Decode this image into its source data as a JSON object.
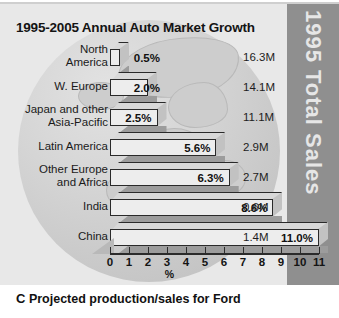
{
  "chart_data": {
    "type": "bar",
    "title": "1995-2005 Annual Auto Market Growth",
    "xlabel": "%",
    "ylabel": "",
    "orientation": "horizontal",
    "xlim": [
      0,
      11
    ],
    "xticks": [
      "0",
      "1",
      "2",
      "3",
      "4",
      "5",
      "6",
      "7",
      "8",
      "9",
      "10",
      "11"
    ],
    "grid": false,
    "categories": [
      "North\nAmerica",
      "W. Europe",
      "Japan and other\nAsia-Pacific",
      "Latin America",
      "Other Europe\nand Africa",
      "India",
      "China"
    ],
    "values": [
      0.5,
      2.0,
      2.5,
      5.6,
      6.3,
      8.6,
      11.0
    ],
    "value_labels": [
      "0.5%",
      "2.0%",
      "2.5%",
      "5.6%",
      "6.3%",
      "8.6%",
      "11.0%"
    ],
    "series": [
      {
        "name": "1995-2005 Annual Auto Market Growth",
        "values": [
          0.5,
          2.0,
          2.5,
          5.6,
          6.3,
          8.6,
          11.0
        ]
      }
    ],
    "secondary_column": {
      "header": "1995 Total Sales",
      "values": [
        "16.3M",
        "14.1M",
        "11.1M",
        "2.9M",
        "2.7M",
        "0.6M",
        "1.4M"
      ]
    },
    "annotations": [
      "C  Projected production/sales for Ford"
    ]
  },
  "sidebar": {
    "label": "1995 Total Sales"
  },
  "axis": {
    "title": "%",
    "ticks": [
      "0",
      "1",
      "2",
      "3",
      "4",
      "5",
      "6",
      "7",
      "8",
      "9",
      "10",
      "11"
    ]
  },
  "caption": {
    "letter": "C",
    "text": "Projected production/sales for Ford"
  },
  "colors": {
    "panel_bg": "#e8e8e8",
    "band_bg": "#8f8f8f",
    "bar_face": "#ededed",
    "bar_shade": "#9c9c9c",
    "ink": "#141414"
  }
}
